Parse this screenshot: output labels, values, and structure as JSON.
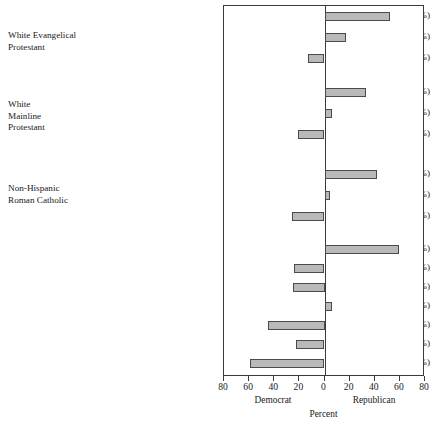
{
  "chart_data": {
    "type": "bar",
    "orientation": "horizontal",
    "title": "",
    "xlabel": "Percent",
    "ylabel": "",
    "xlim": [
      -80,
      80
    ],
    "xticks": [
      -80,
      -60,
      -40,
      -20,
      0,
      20,
      40,
      60,
      80
    ],
    "xticklabels": [
      "80",
      "60",
      "40",
      "20",
      "0",
      "20",
      "40",
      "60",
      "80"
    ],
    "grid": false,
    "legend": false,
    "axis_side_labels": {
      "left": "Democrat",
      "right": "Republican"
    },
    "note": "Negative values lean Democrat (drawn left of zero); positive values lean Republican (drawn right of zero).",
    "groups": [
      {
        "name": "White Evangelical\nProtestant",
        "categories": [
          {
            "label": "Traditionalist (17.2%)",
            "share": 17.2,
            "value": 52
          },
          {
            "label": "Centrist (6.1%)",
            "share": 6.1,
            "value": 17
          },
          {
            "label": "Modernist (1.8%)",
            "share": 1.8,
            "value": -13
          }
        ]
      },
      {
        "name": "White\nMainline\nProtestant",
        "categories": [
          {
            "label": "Traditionalist (3.7%)",
            "share": 3.7,
            "value": 33
          },
          {
            "label": "Centrist (7.8%)",
            "share": 7.8,
            "value": 6
          },
          {
            "label": "Modernist (4.9%)",
            "share": 4.9,
            "value": -21
          }
        ]
      },
      {
        "name": "Non-Hispanic\nRoman Catholic",
        "categories": [
          {
            "label": "Traditionalist (3.6%)",
            "share": 3.6,
            "value": 42
          },
          {
            "label": "Centrist (8.0%)",
            "share": 8.0,
            "value": 4
          },
          {
            "label": "Modernist (5.7%)",
            "share": 5.7,
            "value": -26
          }
        ]
      },
      {
        "name": "",
        "categories": [
          {
            "label": "Latter-Day Saints (1.8%)",
            "share": 1.8,
            "value": 59
          },
          {
            "label": "Unaffiliated (17.3%)",
            "share": 17.3,
            "value": -24
          },
          {
            "label": "Hispanic Catholic (4.5%)",
            "share": 4.5,
            "value": -25
          },
          {
            "label": "Hispanic Protestant (2.6%)",
            "share": 2.6,
            "value": 6
          },
          {
            "label": "Jewish (1.9%)",
            "share": 1.9,
            "value": -45
          },
          {
            "label": "All others (3.9%)",
            "share": 3.9,
            "value": -23
          },
          {
            "label": "Black Protestant (9.3%)",
            "share": 9.3,
            "value": -59
          }
        ]
      }
    ],
    "colors": {
      "bar_fill": "#b9b9b9",
      "bar_stroke": "#4a4a4a",
      "axis": "#3a3a3a",
      "text": "#1a1a1a",
      "background": "#ffffff"
    }
  }
}
